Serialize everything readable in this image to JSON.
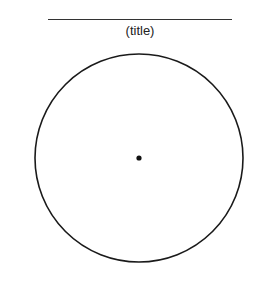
{
  "diagram": {
    "title": "(title)",
    "shape": "circle",
    "has_center_point": true,
    "colors": {
      "stroke": "#1a1a1a",
      "rule": "#333333",
      "background": "#ffffff"
    }
  }
}
